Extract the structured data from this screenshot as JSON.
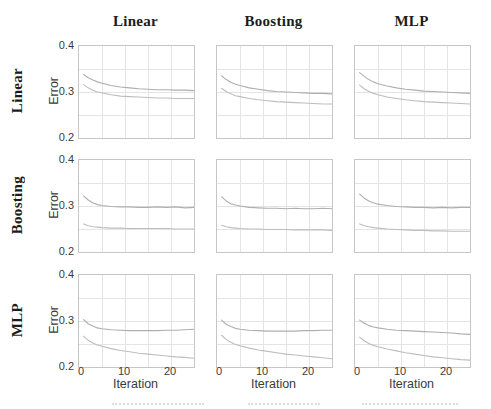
{
  "chart_data": {
    "type": "line",
    "layout": "3x3-grid",
    "col_titles": [
      "Linear",
      "Boosting",
      "MLP"
    ],
    "row_titles": [
      "Linear",
      "Boosting",
      "MLP"
    ],
    "xlabel": "Iteration",
    "ylabel": "Error",
    "xlim": [
      0,
      25
    ],
    "ylim": [
      0.2,
      0.4
    ],
    "xticks": [
      0,
      10,
      20
    ],
    "yticks": [
      0.4,
      0.3,
      0.2
    ],
    "xtick_labels": [
      "0",
      "10",
      "20"
    ],
    "ytick_labels": [
      "0.4",
      "0.3",
      "0.2"
    ],
    "x_gridlines": [
      5,
      10,
      15,
      20,
      25
    ],
    "y_gridlines": [
      0.25,
      0.3,
      0.35
    ],
    "grid": true,
    "legend": "none",
    "x": [
      1,
      2,
      3,
      4,
      5,
      7,
      9,
      11,
      13,
      15,
      17,
      19,
      21,
      23,
      25
    ],
    "subplots": [
      {
        "row": "Linear",
        "col": "Linear",
        "series": [
          {
            "name": "upper-curve",
            "values": [
              0.338,
              0.331,
              0.326,
              0.322,
              0.319,
              0.314,
              0.311,
              0.309,
              0.307,
              0.306,
              0.305,
              0.305,
              0.304,
              0.304,
              0.303
            ]
          },
          {
            "name": "lower-curve",
            "values": [
              0.316,
              0.309,
              0.304,
              0.3,
              0.298,
              0.294,
              0.291,
              0.29,
              0.289,
              0.288,
              0.287,
              0.287,
              0.286,
              0.286,
              0.286
            ]
          }
        ]
      },
      {
        "row": "Linear",
        "col": "Boosting",
        "series": [
          {
            "name": "upper-curve",
            "values": [
              0.335,
              0.327,
              0.321,
              0.317,
              0.314,
              0.309,
              0.306,
              0.303,
              0.301,
              0.3,
              0.299,
              0.298,
              0.297,
              0.297,
              0.296
            ]
          },
          {
            "name": "lower-curve",
            "values": [
              0.308,
              0.301,
              0.296,
              0.292,
              0.29,
              0.286,
              0.283,
              0.281,
              0.279,
              0.278,
              0.277,
              0.276,
              0.275,
              0.274,
              0.274
            ]
          }
        ]
      },
      {
        "row": "Linear",
        "col": "MLP",
        "series": [
          {
            "name": "upper-curve",
            "values": [
              0.342,
              0.334,
              0.327,
              0.322,
              0.318,
              0.313,
              0.309,
              0.306,
              0.304,
              0.302,
              0.301,
              0.3,
              0.299,
              0.298,
              0.297
            ]
          },
          {
            "name": "lower-curve",
            "values": [
              0.315,
              0.307,
              0.301,
              0.297,
              0.294,
              0.289,
              0.286,
              0.283,
              0.281,
              0.279,
              0.278,
              0.277,
              0.276,
              0.275,
              0.274
            ]
          }
        ]
      },
      {
        "row": "Boosting",
        "col": "Linear",
        "series": [
          {
            "name": "upper-curve",
            "values": [
              0.322,
              0.313,
              0.307,
              0.303,
              0.301,
              0.299,
              0.298,
              0.298,
              0.297,
              0.297,
              0.298,
              0.297,
              0.298,
              0.296,
              0.297
            ]
          },
          {
            "name": "lower-curve",
            "values": [
              0.261,
              0.257,
              0.255,
              0.254,
              0.253,
              0.252,
              0.252,
              0.251,
              0.251,
              0.251,
              0.251,
              0.251,
              0.25,
              0.25,
              0.25
            ]
          }
        ]
      },
      {
        "row": "Boosting",
        "col": "Boosting",
        "series": [
          {
            "name": "upper-curve",
            "values": [
              0.32,
              0.311,
              0.305,
              0.302,
              0.3,
              0.297,
              0.296,
              0.295,
              0.295,
              0.294,
              0.295,
              0.294,
              0.294,
              0.295,
              0.294
            ]
          },
          {
            "name": "lower-curve",
            "values": [
              0.258,
              0.255,
              0.253,
              0.252,
              0.251,
              0.25,
              0.25,
              0.249,
              0.249,
              0.249,
              0.248,
              0.248,
              0.248,
              0.248,
              0.247
            ]
          }
        ]
      },
      {
        "row": "Boosting",
        "col": "MLP",
        "series": [
          {
            "name": "upper-curve",
            "values": [
              0.326,
              0.317,
              0.311,
              0.307,
              0.304,
              0.301,
              0.299,
              0.298,
              0.297,
              0.297,
              0.296,
              0.297,
              0.296,
              0.297,
              0.297
            ]
          },
          {
            "name": "lower-curve",
            "values": [
              0.261,
              0.257,
              0.255,
              0.253,
              0.252,
              0.25,
              0.249,
              0.248,
              0.247,
              0.247,
              0.246,
              0.246,
              0.245,
              0.245,
              0.245
            ]
          }
        ]
      },
      {
        "row": "MLP",
        "col": "Linear",
        "series": [
          {
            "name": "upper-curve",
            "values": [
              0.303,
              0.294,
              0.289,
              0.285,
              0.283,
              0.281,
              0.28,
              0.279,
              0.279,
              0.279,
              0.279,
              0.28,
              0.28,
              0.281,
              0.282
            ]
          },
          {
            "name": "lower-curve",
            "values": [
              0.267,
              0.258,
              0.252,
              0.248,
              0.245,
              0.24,
              0.236,
              0.233,
              0.23,
              0.228,
              0.226,
              0.224,
              0.222,
              0.221,
              0.219
            ]
          }
        ]
      },
      {
        "row": "MLP",
        "col": "Boosting",
        "series": [
          {
            "name": "upper-curve",
            "values": [
              0.302,
              0.293,
              0.288,
              0.284,
              0.282,
              0.28,
              0.279,
              0.278,
              0.278,
              0.278,
              0.278,
              0.279,
              0.279,
              0.28,
              0.28
            ]
          },
          {
            "name": "lower-curve",
            "values": [
              0.269,
              0.26,
              0.254,
              0.249,
              0.246,
              0.241,
              0.237,
              0.234,
              0.231,
              0.228,
              0.226,
              0.224,
              0.222,
              0.22,
              0.218
            ]
          }
        ]
      },
      {
        "row": "MLP",
        "col": "MLP",
        "series": [
          {
            "name": "upper-curve",
            "values": [
              0.302,
              0.295,
              0.29,
              0.287,
              0.285,
              0.282,
              0.28,
              0.279,
              0.278,
              0.277,
              0.276,
              0.275,
              0.274,
              0.272,
              0.271
            ]
          },
          {
            "name": "lower-curve",
            "values": [
              0.265,
              0.257,
              0.251,
              0.247,
              0.244,
              0.239,
              0.235,
              0.231,
              0.228,
              0.225,
              0.222,
              0.22,
              0.218,
              0.216,
              0.215
            ]
          }
        ]
      }
    ]
  },
  "colors": {
    "curve_upper": "#aeaeae",
    "curve_lower": "#bdbdbd",
    "grid_line": "#e4e4e4",
    "plot_border": "#c6c6c6",
    "tick_text": "#3b3b3b",
    "title_text": "#1c1c1c"
  }
}
